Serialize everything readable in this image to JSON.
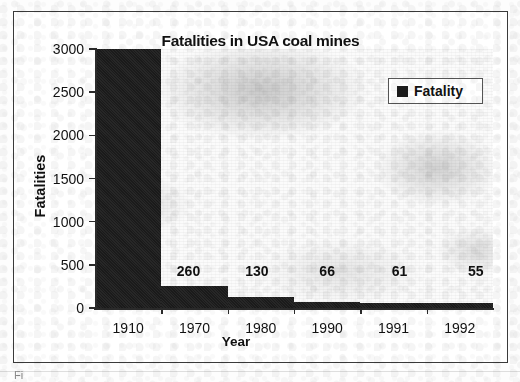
{
  "chart_data": {
    "type": "bar",
    "title": "Fatalities in USA coal mines",
    "xlabel": "Year",
    "ylabel": "Fatalities",
    "categories": [
      "1910",
      "1970",
      "1980",
      "1990",
      "1991",
      "1992"
    ],
    "values": [
      3000,
      260,
      130,
      66,
      61,
      55
    ],
    "data_labels": [
      "",
      "260",
      "130",
      "66",
      "61",
      "55"
    ],
    "series": [
      {
        "name": "Fatality",
        "values": [
          3000,
          260,
          130,
          66,
          61,
          55
        ]
      }
    ],
    "ylim": [
      0,
      3000
    ],
    "ytick_labels": [
      "3000",
      "2500",
      "2000",
      "1500",
      "1000",
      "500",
      "0"
    ],
    "ytick_values": [
      3000,
      2500,
      2000,
      1500,
      1000,
      500,
      0
    ],
    "grid": false,
    "legend": {
      "position": "top-right",
      "entries": [
        {
          "label": "Fatality",
          "color": "#1b1b1b"
        }
      ]
    }
  },
  "figure": {
    "bar_color": "#1b1b1b",
    "axis_color": "#2b2b2b",
    "frame_color": "#3a3a3a",
    "background": "#ffffff",
    "caption_fragment": "Fi"
  }
}
